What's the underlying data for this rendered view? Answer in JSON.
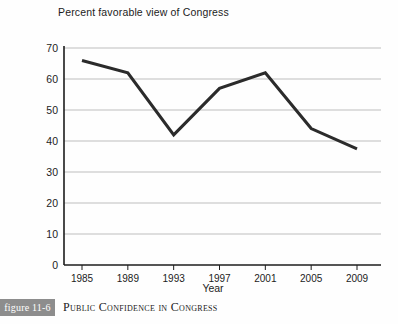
{
  "chart_data": {
    "type": "line",
    "title": "Percent favorable view of Congress",
    "xlabel": "Year",
    "ylabel": "",
    "categories": [
      "1985",
      "1989",
      "1993",
      "1997",
      "2001",
      "2005",
      "2009"
    ],
    "values": [
      66,
      62,
      42,
      57,
      62,
      44,
      37.5
    ],
    "series": [
      {
        "name": "Percent favorable view of Congress",
        "values": [
          66,
          62,
          42,
          57,
          62,
          44,
          37.5
        ]
      }
    ],
    "ylim": [
      0,
      70
    ],
    "yticks": [
      0,
      10,
      20,
      30,
      40,
      50,
      60,
      70
    ],
    "ytick_labels": [
      "0",
      "10",
      "20",
      "30",
      "40",
      "50",
      "60",
      "70"
    ],
    "xtick_labels": [
      "1985",
      "1989",
      "1993",
      "1997",
      "2001",
      "2005",
      "2009"
    ],
    "grid": "horizontal",
    "legend": "none",
    "line_color": "#2b2b2b",
    "grid_color": "#b8b8b8",
    "axis_color": "#1c1c1c"
  },
  "caption": {
    "figure_tag": "figure 11-6",
    "title": "Public Confidence in Congress",
    "tag_background": "#8d8d8d"
  }
}
